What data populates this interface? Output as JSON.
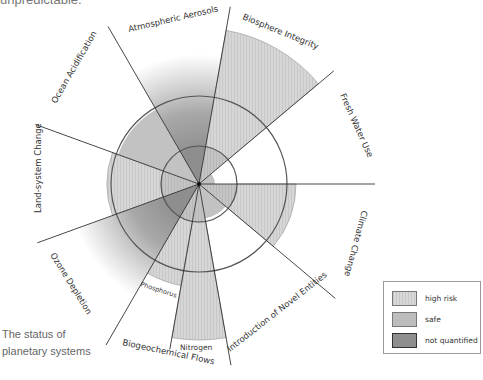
{
  "header": {
    "clipped_text": "unpredictable."
  },
  "caption": {
    "line1": "The status of",
    "line2": "planetary systems"
  },
  "legend": {
    "items": [
      {
        "label": "high risk",
        "color": "#d3d3d3",
        "style": "hatched"
      },
      {
        "label": "safe",
        "color": "#bdbdbd",
        "style": "solid"
      },
      {
        "label": "not quantified",
        "color": "#8e8e8e",
        "style": "dark"
      }
    ]
  },
  "chart_data": {
    "type": "radial-sector",
    "title": "The status of planetary systems",
    "center": [
      199,
      184
    ],
    "safe_boundary_radius": 38,
    "zone_of_uncertainty_radius": 88,
    "sectors": [
      {
        "name": "Climate Change",
        "start_deg": 0,
        "end_deg": 40,
        "status": "high risk",
        "extent_radius": 97
      },
      {
        "name": "Introduction of Novel Entities",
        "start_deg": 40,
        "end_deg": 80,
        "status": "safe",
        "extent_radius": 35
      },
      {
        "name": "Nitrogen",
        "group": "Biogeochemical Flows",
        "start_deg": 80,
        "end_deg": 100,
        "status": "high risk",
        "extent_radius": 156
      },
      {
        "name": "Phosphorus",
        "group": "Biogeochemical Flows",
        "start_deg": 100,
        "end_deg": 120,
        "status": "high risk",
        "extent_radius": 103
      },
      {
        "name": "Ozone Depletion",
        "start_deg": 120,
        "end_deg": 160,
        "status": "not quantified",
        "extent_radius": 88
      },
      {
        "name": "Land-system Change",
        "start_deg": 160,
        "end_deg": 200,
        "status": "high risk",
        "extent_radius": 92
      },
      {
        "name": "Ocean Acidification",
        "start_deg": 200,
        "end_deg": 240,
        "status": "safe",
        "extent_radius": 86
      },
      {
        "name": "Atmospheric Aerosols",
        "start_deg": 240,
        "end_deg": 280,
        "status": "not quantified",
        "extent_radius": 88
      },
      {
        "name": "Biosphere Integrity",
        "start_deg": 280,
        "end_deg": 320,
        "status": "high risk",
        "extent_radius": 156
      },
      {
        "name": "Fresh Water Use",
        "start_deg": 320,
        "end_deg": 360,
        "status": "safe",
        "extent_radius": 16
      }
    ],
    "labels": {
      "climate": "Climate Change",
      "novel": "Introduction of Novel Entities",
      "biogeo": "Biogeochemical Flows",
      "nitrogen": "Nitrogen",
      "phosphorus": "Phosphorus",
      "ozone": "Ozone Depletion",
      "land": "Land-system Change",
      "ocean": "Ocean Acidification",
      "aerosols": "Atmospheric Aerosols",
      "biosphere": "Biosphere Integrity",
      "freshwater": "Fresh Water Use"
    }
  }
}
